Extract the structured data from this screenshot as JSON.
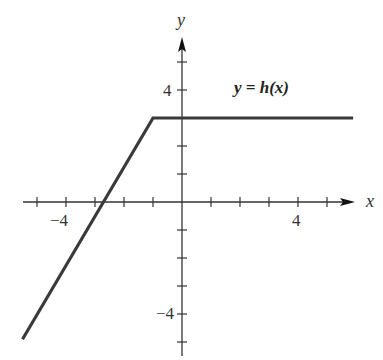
{
  "chart_data": {
    "type": "line",
    "title": "",
    "xlabel": "x",
    "ylabel": "y",
    "xlim": [
      -5.5,
      5.9
    ],
    "ylim": [
      -5.5,
      5.8
    ],
    "grid": false,
    "x_ticks": [
      -5,
      -4,
      -3,
      -2,
      -1,
      1,
      2,
      3,
      4,
      5
    ],
    "y_ticks": [
      -5,
      -4,
      -3,
      -2,
      -1,
      1,
      2,
      3,
      4,
      5
    ],
    "x_tick_labels": [
      {
        "value": -4,
        "label": "−4"
      },
      {
        "value": 4,
        "label": "4"
      }
    ],
    "y_tick_labels": [
      {
        "value": 4,
        "label": "4"
      },
      {
        "value": -4,
        "label": "−4"
      }
    ],
    "series": [
      {
        "name": "y = h(x)",
        "x": [
          -5.5,
          -1,
          5.9
        ],
        "y": [
          -4.9,
          3,
          3
        ],
        "color": "#3a3a3a"
      }
    ],
    "annotations": [
      {
        "text": "y = h(x)",
        "x": 1.8,
        "y": 4
      }
    ],
    "legend": "none"
  },
  "labels": {
    "x_axis": "x",
    "y_axis": "y",
    "function": "y = h(x)",
    "x_neg4": "−4",
    "x_pos4": "4",
    "y_pos4": "4",
    "y_neg4": "−4"
  }
}
